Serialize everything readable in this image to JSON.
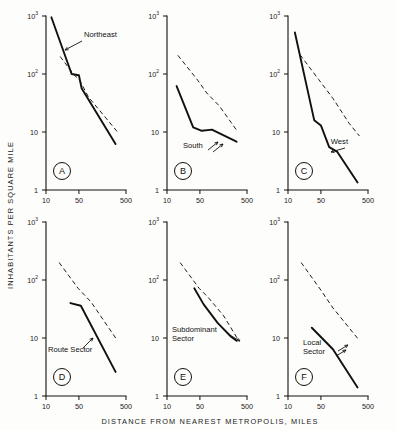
{
  "figure": {
    "axis_titles": {
      "y": "INHABITANTS   PER   SQUARE   MILE",
      "x": "DISTANCE   FROM   NEAREST   METROPOLIS,  MILES"
    },
    "x_ticks": [
      "10",
      "50",
      "500"
    ],
    "y_ticks": [
      "10",
      "10",
      "10",
      "1"
    ],
    "y_tick_exponents": [
      "3",
      "2",
      "",
      ""
    ],
    "panels": [
      {
        "letter": "A",
        "curve_label": "Northeast"
      },
      {
        "letter": "B",
        "curve_label": "South"
      },
      {
        "letter": "C",
        "curve_label": "West"
      },
      {
        "letter": "D",
        "curve_label": "Route Sector"
      },
      {
        "letter": "E",
        "curve_label_line1": "Subdominant",
        "curve_label_line2": "Sector"
      },
      {
        "letter": "F",
        "curve_label_line1": "Local",
        "curve_label_line2": "Sector"
      }
    ]
  },
  "chart_data": {
    "type": "line",
    "title": "",
    "xlabel": "DISTANCE FROM NEAREST METROPOLIS, MILES",
    "ylabel": "INHABITANTS PER SQUARE MILE",
    "xscale": "log",
    "yscale": "log",
    "xlim": [
      10,
      500
    ],
    "ylim": [
      1,
      1000
    ],
    "xticks": [
      10,
      50,
      500
    ],
    "yticks": [
      1,
      10,
      100,
      1000
    ],
    "grid": false,
    "legend": "none",
    "panel_layout": "2 rows x 3 columns",
    "panels": [
      {
        "panel": "A",
        "label": "Northeast",
        "series": [
          {
            "name": "Northeast",
            "style": "solid",
            "x": [
              13,
              35,
              50,
              57,
              300
            ],
            "y": [
              950,
              100,
              95,
              57,
              6.2
            ]
          },
          {
            "name": "reference",
            "style": "dashed",
            "x": [
              20,
              40,
              50,
              80,
              330
            ],
            "y": [
              200,
              95,
              82,
              40,
              10
            ]
          }
        ]
      },
      {
        "panel": "B",
        "label": "South",
        "series": [
          {
            "name": "South",
            "style": "solid",
            "x": [
              16,
              36,
              55,
              90,
              300
            ],
            "y": [
              62,
              12,
              10.5,
              11,
              6.8
            ]
          },
          {
            "name": "reference",
            "style": "dashed",
            "x": [
              17,
              45,
              70,
              130,
              320
            ],
            "y": [
              210,
              78,
              47,
              28,
              10
            ]
          }
        ]
      },
      {
        "panel": "C",
        "label": "West",
        "series": [
          {
            "name": "West",
            "style": "solid",
            "x": [
              14,
              36,
              50,
              75,
              110,
              300
            ],
            "y": [
              520,
              16,
              13,
              5.5,
              4.6,
              1.35
            ]
          },
          {
            "name": "reference",
            "style": "dashed",
            "x": [
              18,
              45,
              90,
              200,
              330
            ],
            "y": [
              215,
              80,
              38,
              14,
              8.5
            ]
          }
        ]
      },
      {
        "panel": "D",
        "label": "Route Sector",
        "series": [
          {
            "name": "Route Sector",
            "style": "solid",
            "x": [
              33,
              55,
              300
            ],
            "y": [
              40,
              36,
              2.6
            ]
          },
          {
            "name": "reference",
            "style": "dashed",
            "x": [
              19,
              48,
              90,
              330
            ],
            "y": [
              200,
              72,
              42,
              9
            ]
          }
        ]
      },
      {
        "panel": "E",
        "label": "Subdominant Sector",
        "series": [
          {
            "name": "Subdominant Sector",
            "style": "solid",
            "x": [
              38,
              60,
              120,
              230,
              300
            ],
            "y": [
              72,
              38,
              18,
              10.5,
              9
            ]
          },
          {
            "name": "reference",
            "style": "dashed",
            "x": [
              19,
              48,
              75,
              160,
              320
            ],
            "y": [
              200,
              72,
              50,
              24,
              9.5
            ]
          }
        ]
      },
      {
        "panel": "F",
        "label": "Local Sector",
        "series": [
          {
            "name": "Local Sector",
            "style": "solid",
            "x": [
              32,
              90,
              300
            ],
            "y": [
              15,
              6.4,
              1.4
            ]
          },
          {
            "name": "reference",
            "style": "dashed",
            "x": [
              19,
              48,
              90,
              330
            ],
            "y": [
              200,
              70,
              33,
              9
            ]
          }
        ]
      }
    ]
  }
}
